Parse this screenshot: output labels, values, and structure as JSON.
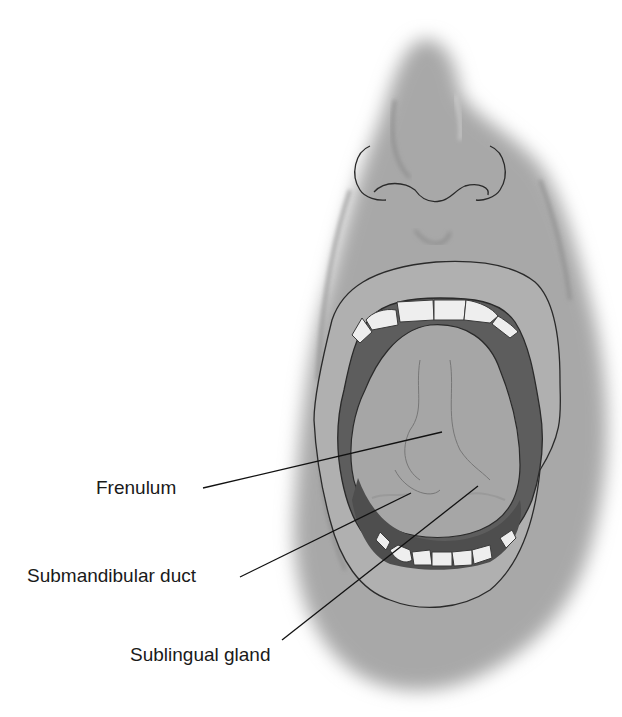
{
  "figure": {
    "colors": {
      "skin": "#a9a9a9",
      "lip": "#b4b4b4",
      "mouth_dark": "#5a5a5a",
      "tongue": "#a4a4a4",
      "teeth": "#efefef",
      "line": "#1a1a1a"
    }
  },
  "labels": [
    {
      "id": "frenulum",
      "text": "Frenulum",
      "x": 96,
      "y": 478,
      "line": [
        203,
        488,
        442,
        432
      ]
    },
    {
      "id": "submandibular-duct",
      "text": "Submandibular duct",
      "x": 27,
      "y": 566,
      "line": [
        240,
        577,
        411,
        493
      ]
    },
    {
      "id": "sublingual-gland",
      "text": "Sublingual gland",
      "x": 130,
      "y": 645,
      "line": [
        282,
        640,
        478,
        486
      ]
    }
  ]
}
